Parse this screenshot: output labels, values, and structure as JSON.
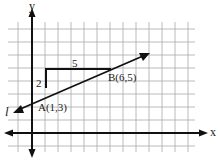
{
  "diagram": {
    "type": "coordinate-plane",
    "axes": {
      "x_label": "x",
      "y_label": "y"
    },
    "line": {
      "name": "l"
    },
    "points": [
      {
        "name": "A",
        "label": "A(1,3)",
        "x": 1,
        "y": 3
      },
      {
        "name": "B",
        "label": "B(6,5)",
        "x": 6,
        "y": 5
      }
    ],
    "slope_triangle": {
      "rise_label": "2",
      "run_label": "5"
    },
    "colors": {
      "grid": "#9a9a9a",
      "ink": "#111111",
      "background": "#ffffff"
    }
  }
}
